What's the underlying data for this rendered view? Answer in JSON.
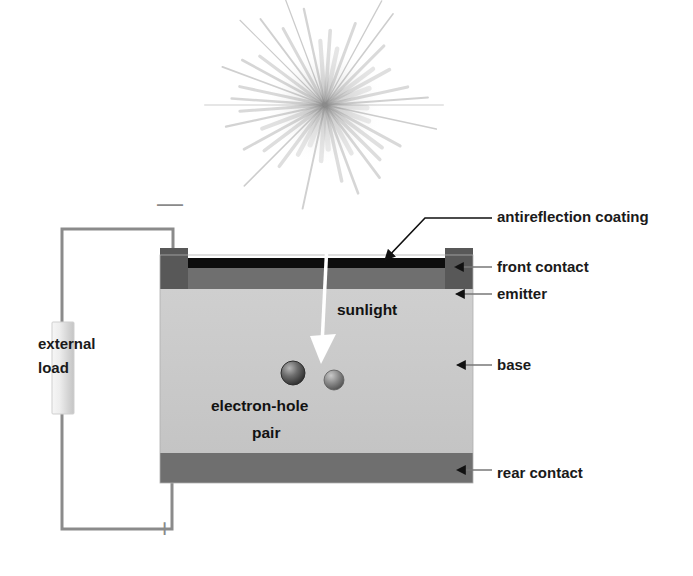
{
  "figure": {
    "background_color": "#ffffff"
  },
  "sun": {
    "name": "sunlight-starburst",
    "center_x": 325,
    "center_y": 105,
    "ray_count": 44,
    "color": "#8d8d8d"
  },
  "cell": {
    "left": 160,
    "right": 473,
    "top": 255,
    "bottom": 483,
    "layers": [
      {
        "key": "arc",
        "label": "antireflection coating",
        "color": "#0d0d0d",
        "y": 258,
        "height": 9
      },
      {
        "key": "emitter",
        "label": "emitter",
        "color": "#6f6f6f",
        "y": 267,
        "height": 22
      },
      {
        "key": "base",
        "label": "base",
        "color": "#c8c8c8",
        "y": 289,
        "height": 164
      },
      {
        "key": "rear",
        "label": "rear contact",
        "color": "#6f6f6f",
        "y": 453,
        "height": 30
      }
    ],
    "front_contacts": {
      "label": "front contact",
      "color": "#585858",
      "left_block": {
        "x": 160,
        "y": 248,
        "width": 28,
        "height": 41
      },
      "right_block": {
        "x": 445,
        "y": 248,
        "width": 28,
        "height": 41
      }
    }
  },
  "callouts": [
    {
      "name": "antireflection-coating",
      "label": "antireflection coating",
      "text_x": 497,
      "text_y": 222
    },
    {
      "name": "front-contact",
      "label": "front contact",
      "text_x": 497,
      "text_y": 272
    },
    {
      "name": "emitter",
      "label": "emitter",
      "text_x": 497,
      "text_y": 299
    },
    {
      "name": "base",
      "label": "base",
      "text_x": 497,
      "text_y": 370
    },
    {
      "name": "rear-contact",
      "label": "rear contact",
      "text_x": 497,
      "text_y": 478
    }
  ],
  "inner_labels": {
    "sunlight": {
      "label": "sunlight",
      "x": 337,
      "y": 315
    },
    "electron_hole_line1": {
      "label": "electron-hole",
      "x": 211,
      "y": 411
    },
    "electron_hole_line2": {
      "label": "pair",
      "x": 252,
      "y": 438
    }
  },
  "sunlight_arrow": {
    "name": "sunlight-arrow",
    "color": "#ffffff",
    "from_x": 327,
    "from_y": 243,
    "to_x": 322,
    "to_y": 362
  },
  "carriers": [
    {
      "name": "electron-sphere",
      "x": 293,
      "y": 373,
      "r": 12,
      "color": "#4a4a4a"
    },
    {
      "name": "hole-sphere",
      "x": 334,
      "y": 380,
      "r": 10,
      "color": "#6b6b6b"
    }
  ],
  "circuit": {
    "wire_color": "#8b8b8b",
    "wire_width": 3,
    "top_y": 229,
    "bottom_y": 529,
    "left_x": 62,
    "cell_top_x": 173,
    "cell_bottom_x": 172,
    "load": {
      "label_line1": "external",
      "label_line2": "load",
      "label_x": 38,
      "label_y1": 349,
      "label_y2": 373,
      "box": {
        "x": 52,
        "y": 322,
        "width": 22,
        "height": 92
      },
      "color": "#e2e2e2"
    },
    "terminals": {
      "negative": {
        "symbol": "—",
        "x": 157,
        "y": 210
      },
      "positive": {
        "symbol": "+",
        "x": 157,
        "y": 535
      }
    }
  }
}
